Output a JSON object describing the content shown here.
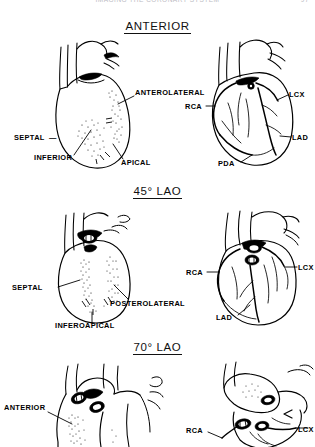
{
  "running_head": {
    "title": "IMAGING THE CORONARY SYSTEM",
    "folio": "97"
  },
  "figure": {
    "sections": [
      {
        "id": "anterior",
        "heading": "ANTERIOR",
        "left_panel": {
          "caption": "myocardial-segments",
          "labels": [
            {
              "key": "anterolateral",
              "text": "ANTEROLATERAL"
            },
            {
              "key": "septal",
              "text": "SEPTAL"
            },
            {
              "key": "septal_dash",
              "text": "—"
            },
            {
              "key": "inferior",
              "text": "INFERIOR"
            },
            {
              "key": "apical",
              "text": "APICAL"
            }
          ]
        },
        "right_panel": {
          "caption": "coronary-arteries",
          "labels": [
            {
              "key": "rca",
              "text": "RCA"
            },
            {
              "key": "lcx",
              "text": "LCX"
            },
            {
              "key": "lad",
              "text": "LAD"
            },
            {
              "key": "pda",
              "text": "PDA"
            }
          ]
        }
      },
      {
        "id": "lao45",
        "heading": "45° LAO",
        "left_panel": {
          "caption": "myocardial-segments",
          "labels": [
            {
              "key": "septal",
              "text": "SEPTAL"
            },
            {
              "key": "posterolateral",
              "text": "POSTEROLATERAL"
            },
            {
              "key": "inferoapical",
              "text": "INFEROAPICAL"
            }
          ]
        },
        "right_panel": {
          "caption": "coronary-arteries",
          "labels": [
            {
              "key": "rca",
              "text": "RCA"
            },
            {
              "key": "lcx",
              "text": "LCX"
            },
            {
              "key": "lad",
              "text": "LAD"
            }
          ]
        }
      },
      {
        "id": "lao70",
        "heading": "70° LAO",
        "left_panel": {
          "caption": "myocardial-segments",
          "labels": [
            {
              "key": "anterior",
              "text": "ANTERIOR"
            }
          ]
        },
        "right_panel": {
          "caption": "coronary-arteries",
          "labels": [
            {
              "key": "rca",
              "text": "RCA"
            },
            {
              "key": "lcx",
              "text": "LCX"
            }
          ]
        }
      }
    ]
  }
}
